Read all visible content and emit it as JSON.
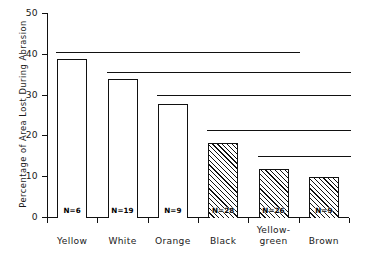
{
  "chart_data": {
    "type": "bar",
    "title": "",
    "xlabel": "",
    "ylabel": "Percentage of Area Lost During Abrasion",
    "categories": [
      "Yellow",
      "White",
      "Orange",
      "Black",
      "Yellow-green",
      "Brown"
    ],
    "category_lines": [
      [
        "Yellow"
      ],
      [
        "White"
      ],
      [
        "Orange"
      ],
      [
        "Black"
      ],
      [
        "Yellow-",
        "green"
      ],
      [
        "Brown"
      ]
    ],
    "values": [
      39,
      34,
      28,
      18.5,
      12,
      10
    ],
    "point_labels": [
      "N=6",
      "N=19",
      "N=9",
      "N=28",
      "N=26",
      "N=9"
    ],
    "sample_sizes": [
      6,
      19,
      9,
      28,
      26,
      9
    ],
    "bar_styles": [
      "open",
      "open",
      "open",
      "hatched",
      "hatched",
      "hatched"
    ],
    "ylim": [
      0,
      50
    ],
    "yticks": [
      0,
      10,
      20,
      30,
      40,
      50
    ],
    "ytick_labels": [
      "0",
      "10",
      "20",
      "30",
      "40",
      "50"
    ],
    "grid": false,
    "legend": "none",
    "comparison_lines": [
      {
        "y": 40.5,
        "from_category": "Yellow",
        "to_category": "Yellow-green"
      },
      {
        "y": 35.5,
        "from_category": "White",
        "to_category": "Brown"
      },
      {
        "y": 29.8,
        "from_category": "Orange",
        "to_category": "Brown"
      },
      {
        "y": 21.3,
        "from_category": "Black",
        "to_category": "Brown"
      },
      {
        "y": 15.0,
        "from_category": "Yellow-green",
        "to_category": "Brown"
      }
    ]
  }
}
